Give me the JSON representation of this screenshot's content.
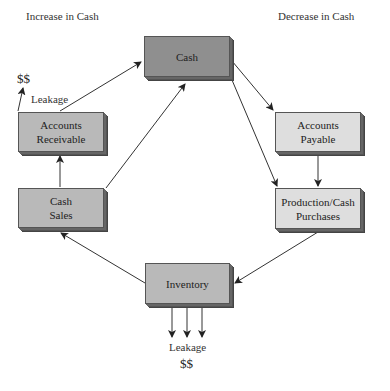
{
  "headers": {
    "increase": "Increase in Cash",
    "decrease": "Decrease in Cash"
  },
  "nodes": {
    "cash": {
      "lines": [
        "Cash"
      ]
    },
    "accounts_receivable": {
      "lines": [
        "Accounts",
        "Receivable"
      ]
    },
    "cash_sales": {
      "lines": [
        "Cash",
        "Sales"
      ]
    },
    "accounts_payable": {
      "lines": [
        "Accounts",
        "Payable"
      ]
    },
    "production": {
      "lines": [
        "Production/Cash",
        "Purchases"
      ]
    },
    "inventory": {
      "lines": [
        "Inventory"
      ]
    }
  },
  "leakage_top": {
    "money": "$$",
    "label": "Leakage"
  },
  "leakage_bottom": {
    "label": "Leakage",
    "money": "$$"
  },
  "colors": {
    "cash_fill": "#8f8f8f",
    "increase_side_fill": "#b9b9b9",
    "decrease_side_fill": "#dedede",
    "line": "#333333"
  },
  "edges": [
    {
      "from": "accounts_receivable",
      "to": "cash"
    },
    {
      "from": "cash_sales",
      "to": "cash"
    },
    {
      "from": "cash_sales",
      "to": "accounts_receivable"
    },
    {
      "from": "cash",
      "to": "accounts_payable"
    },
    {
      "from": "cash",
      "to": "production"
    },
    {
      "from": "accounts_payable",
      "to": "production"
    },
    {
      "from": "production",
      "to": "inventory"
    },
    {
      "from": "inventory",
      "to": "cash_sales"
    }
  ]
}
